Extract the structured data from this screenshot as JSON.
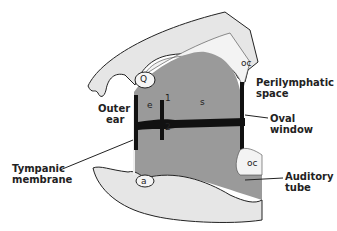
{
  "diagram": {
    "type": "anatomical cross-section",
    "labels": {
      "outer_ear": [
        "Outer",
        "ear"
      ],
      "tympanic_membrane": [
        "Tympanic",
        "membrane"
      ],
      "perilymphatic_space": [
        "Perilymphatic",
        "space"
      ],
      "oval_window": "Oval window",
      "auditory_tube": [
        "Auditory",
        "tube"
      ],
      "q": "Q",
      "a": "a",
      "oc_top": "oc",
      "oc_bottom": "oc",
      "e": "e",
      "s": "s",
      "one": "1",
      "two": "2"
    },
    "colors": {
      "bone_light": "#e6e6e6",
      "cartilage_dotted": "#f1f1f1",
      "cavity_gray": "#9a9a9a",
      "ossicle_black": "#111111",
      "outline": "#222222"
    }
  }
}
